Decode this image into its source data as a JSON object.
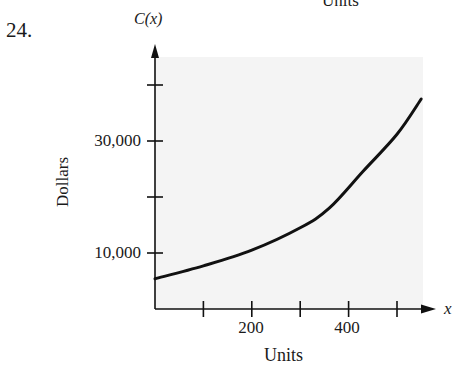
{
  "problem_number": "24.",
  "top_cut_text": "Units",
  "chart_data": {
    "type": "line",
    "title": "",
    "function_label": "C(x)",
    "xvar_label": "x",
    "xlabel": "Units",
    "ylabel": "Dollars",
    "x_ticks": [
      100,
      200,
      300,
      400,
      500
    ],
    "x_tick_labels": [
      "200",
      "400"
    ],
    "y_ticks": [
      10000,
      20000,
      30000,
      40000
    ],
    "y_tick_labels": [
      "10,000",
      "30,000"
    ],
    "xlim": [
      0,
      560
    ],
    "ylim": [
      0,
      45000
    ],
    "grid": false,
    "background": "#f4f4f4",
    "line_color": "#111111",
    "series": [
      {
        "name": "C(x)",
        "x": [
          0,
          100,
          200,
          300,
          360,
          430,
          500,
          550
        ],
        "y": [
          5400,
          7700,
          10500,
          14500,
          18000,
          24600,
          31200,
          37500
        ]
      }
    ]
  }
}
